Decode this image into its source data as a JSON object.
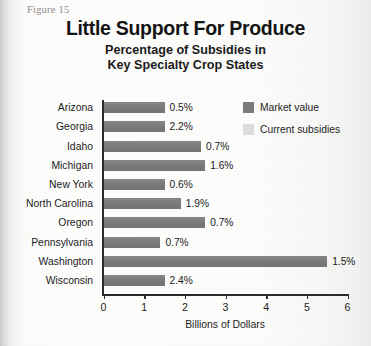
{
  "figure": {
    "label": "Figure 15",
    "title": "Little Support For Produce",
    "subtitle_line1": "Percentage of Subsidies in",
    "subtitle_line2": "Key Specialty Crop States"
  },
  "colors": {
    "market_value": "#7b7b7b",
    "current_subsidies": "#dcdcdc",
    "axis": "#2b2b2b",
    "text": "#1c1c1c",
    "figure_label": "#8e8e8c"
  },
  "legend": {
    "position": "top-right",
    "items": [
      {
        "label": "Market value",
        "swatch": "market"
      },
      {
        "label": "Current subsidies",
        "swatch": "subsidy"
      }
    ]
  },
  "axis": {
    "x_title": "Billions of Dollars",
    "x_ticks": [
      "0",
      "1",
      "2",
      "3",
      "4",
      "5",
      "6"
    ],
    "x_min": 0,
    "x_max": 6
  },
  "chart_data": {
    "type": "bar",
    "orientation": "horizontal",
    "title": "Little Support For Produce",
    "subtitle": "Percentage of Subsidies in Key Specialty Crop States",
    "xlabel": "Billions of Dollars",
    "ylabel": "",
    "xlim": [
      0,
      6
    ],
    "grid": false,
    "legend_position": "top-right",
    "categories": [
      "Arizona",
      "Georgia",
      "Idaho",
      "Michigan",
      "New York",
      "North Carolina",
      "Oregon",
      "Pennsylvania",
      "Washington",
      "Wisconsin"
    ],
    "series": [
      {
        "name": "Market value",
        "color": "#7b7b7b",
        "values": [
          1.5,
          1.5,
          2.4,
          2.5,
          1.5,
          1.9,
          2.5,
          1.4,
          5.5,
          1.5
        ]
      },
      {
        "name": "Current subsidies",
        "color": "#dcdcdc",
        "values": [
          0.03,
          0.03,
          0.03,
          0.03,
          0.03,
          0.03,
          0.03,
          0.03,
          0.03,
          0.03
        ]
      }
    ],
    "data_labels": [
      "0.5%",
      "2.2%",
      "0.7%",
      "1.6%",
      "0.6%",
      "1.9%",
      "0.7%",
      "0.7%",
      "1.5%",
      "2.4%"
    ],
    "data_label_meaning": "Current subsidies as a percentage of market value"
  },
  "rows": [
    {
      "state": "Arizona",
      "market": 1.5,
      "subsidy": 0.03,
      "pct": "0.5%"
    },
    {
      "state": "Georgia",
      "market": 1.5,
      "subsidy": 0.03,
      "pct": "2.2%"
    },
    {
      "state": "Idaho",
      "market": 2.4,
      "subsidy": 0.03,
      "pct": "0.7%"
    },
    {
      "state": "Michigan",
      "market": 2.5,
      "subsidy": 0.03,
      "pct": "1.6%"
    },
    {
      "state": "New York",
      "market": 1.5,
      "subsidy": 0.03,
      "pct": "0.6%"
    },
    {
      "state": "North Carolina",
      "market": 1.9,
      "subsidy": 0.03,
      "pct": "1.9%"
    },
    {
      "state": "Oregon",
      "market": 2.5,
      "subsidy": 0.03,
      "pct": "0.7%"
    },
    {
      "state": "Pennsylvania",
      "market": 1.4,
      "subsidy": 0.03,
      "pct": "0.7%"
    },
    {
      "state": "Washington",
      "market": 5.5,
      "subsidy": 0.03,
      "pct": "1.5%"
    },
    {
      "state": "Wisconsin",
      "market": 1.5,
      "subsidy": 0.03,
      "pct": "2.4%"
    }
  ]
}
